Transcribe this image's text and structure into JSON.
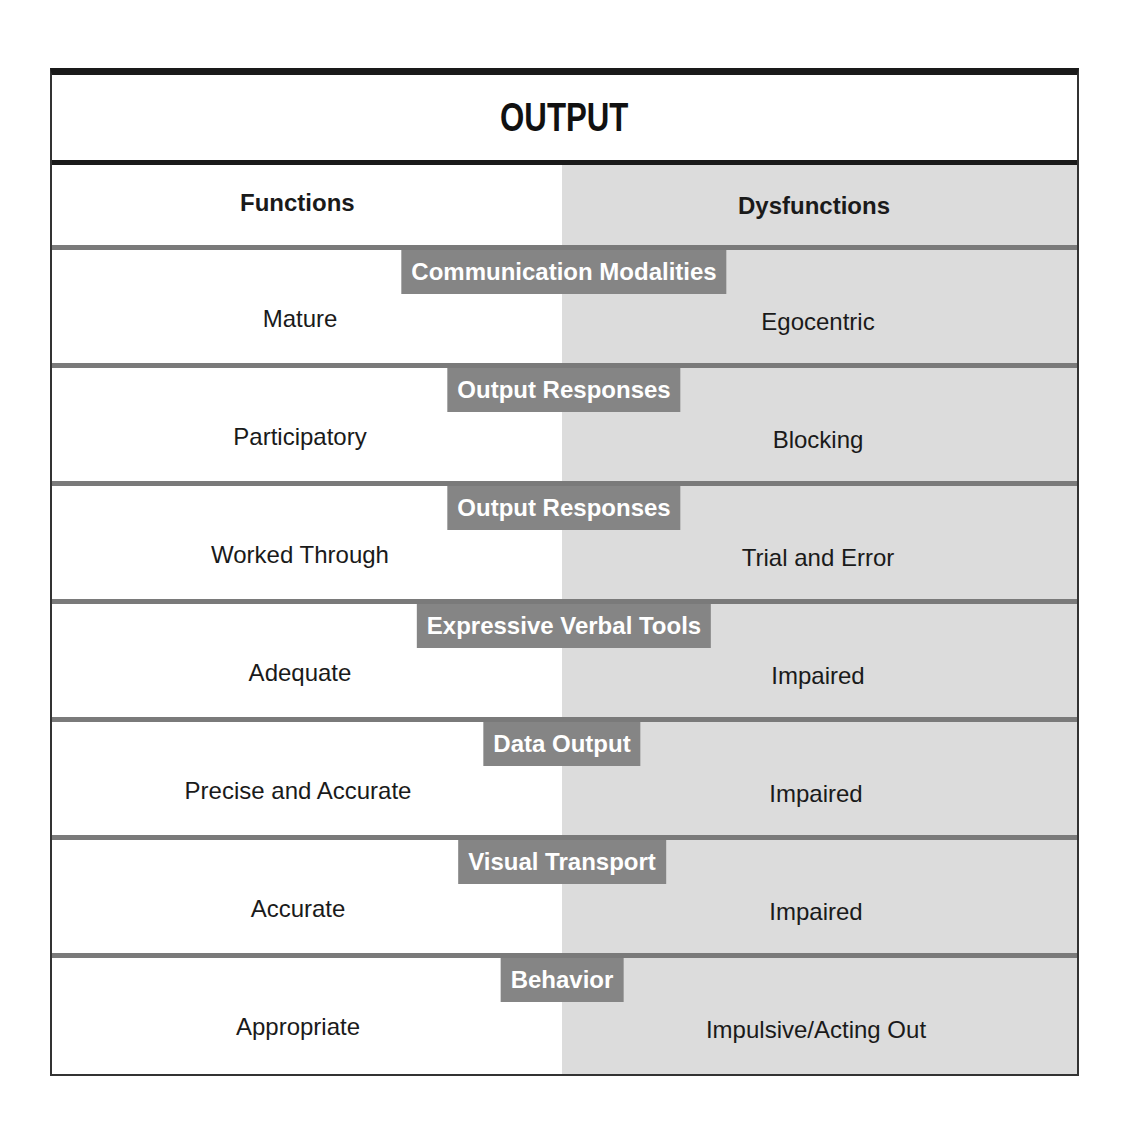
{
  "title": "OUTPUT",
  "columns": {
    "left": "Functions",
    "right": "Dysfunctions"
  },
  "colors": {
    "shade": "#dcdcdc",
    "tag_bg": "#858585",
    "border": "#1a1a1a"
  },
  "rows": [
    {
      "category": "Communication Modalities",
      "function": "Mature",
      "dysfunction": "Egocentric"
    },
    {
      "category": "Output Responses",
      "function": "Participatory",
      "dysfunction": "Blocking"
    },
    {
      "category": "Output Responses",
      "function": "Worked Through",
      "dysfunction": "Trial and Error"
    },
    {
      "category": "Expressive Verbal Tools",
      "function": "Adequate",
      "dysfunction": "Impaired"
    },
    {
      "category": "Data Output",
      "function": "Precise and Accurate",
      "dysfunction": "Impaired"
    },
    {
      "category": "Visual Transport",
      "function": "Accurate",
      "dysfunction": "Impaired"
    },
    {
      "category": "Behavior",
      "function": "Appropriate",
      "dysfunction": "Impulsive/Acting Out"
    }
  ]
}
